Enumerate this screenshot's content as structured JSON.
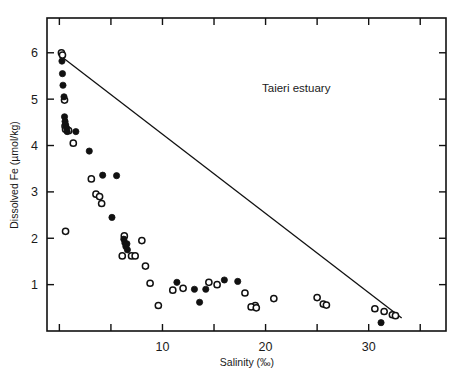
{
  "chart_data": {
    "type": "scatter",
    "title": "",
    "annotation": "Taieri estuary",
    "xlabel": "Salinity (‰)",
    "ylabel": "Dissolved Fe (µmol/kg)",
    "xlim": [
      -1.2,
      37.5
    ],
    "ylim": [
      0,
      6.75
    ],
    "xticks": [
      0,
      5,
      10,
      15,
      20,
      25,
      30,
      35
    ],
    "xtick_labels": [
      "",
      "",
      "10",
      "",
      "20",
      "",
      "30",
      ""
    ],
    "yticks": [
      1,
      2,
      3,
      4,
      5,
      6
    ],
    "ytick_labels": [
      "1",
      "2",
      "3",
      "4",
      "5",
      "6"
    ],
    "grid": false,
    "legend_position": "none",
    "frame": "box",
    "tick_direction": "in",
    "series": [
      {
        "name": "filled-circles",
        "marker": "filled-circle",
        "color": "#111111",
        "points": [
          [
            0.25,
            5.82
          ],
          [
            0.3,
            5.55
          ],
          [
            0.35,
            5.3
          ],
          [
            0.45,
            5.05
          ],
          [
            0.5,
            4.62
          ],
          [
            0.55,
            4.52
          ],
          [
            0.6,
            4.45
          ],
          [
            0.7,
            4.38
          ],
          [
            0.75,
            4.3
          ],
          [
            1.6,
            4.3
          ],
          [
            2.9,
            3.88
          ],
          [
            4.2,
            3.36
          ],
          [
            5.55,
            3.35
          ],
          [
            5.1,
            2.45
          ],
          [
            6.25,
            1.98
          ],
          [
            6.35,
            1.9
          ],
          [
            6.45,
            1.82
          ],
          [
            6.55,
            1.88
          ],
          [
            6.6,
            1.75
          ],
          [
            11.4,
            1.05
          ],
          [
            13.1,
            0.9
          ],
          [
            14.2,
            0.9
          ],
          [
            13.6,
            0.62
          ],
          [
            17.3,
            1.07
          ],
          [
            16.0,
            1.1
          ],
          [
            31.2,
            0.18
          ]
        ]
      },
      {
        "name": "open-circles",
        "marker": "open-circle",
        "color": "#111111",
        "points": [
          [
            0.2,
            6.0
          ],
          [
            0.3,
            5.95
          ],
          [
            0.5,
            4.98
          ],
          [
            0.55,
            4.42
          ],
          [
            0.6,
            4.35
          ],
          [
            0.9,
            4.32
          ],
          [
            1.35,
            4.05
          ],
          [
            3.1,
            3.28
          ],
          [
            3.55,
            2.95
          ],
          [
            3.9,
            2.9
          ],
          [
            4.1,
            2.75
          ],
          [
            0.6,
            2.15
          ],
          [
            6.3,
            2.05
          ],
          [
            8.0,
            1.95
          ],
          [
            6.1,
            1.62
          ],
          [
            7.0,
            1.62
          ],
          [
            7.35,
            1.62
          ],
          [
            8.35,
            1.4
          ],
          [
            8.8,
            1.03
          ],
          [
            12.0,
            0.92
          ],
          [
            11.0,
            0.88
          ],
          [
            14.5,
            1.05
          ],
          [
            15.3,
            1.0
          ],
          [
            9.6,
            0.55
          ],
          [
            19.0,
            0.55
          ],
          [
            18.6,
            0.52
          ],
          [
            19.1,
            0.5
          ],
          [
            18.0,
            0.82
          ],
          [
            20.8,
            0.7
          ],
          [
            25.0,
            0.72
          ],
          [
            25.6,
            0.58
          ],
          [
            25.9,
            0.56
          ],
          [
            30.6,
            0.48
          ],
          [
            31.5,
            0.42
          ],
          [
            32.3,
            0.35
          ],
          [
            32.6,
            0.33
          ]
        ]
      }
    ],
    "reference_line": {
      "name": "conservative-mixing-line",
      "from": [
        0,
        5.95
      ],
      "to": [
        33.2,
        0.28
      ],
      "style": "solid"
    }
  }
}
